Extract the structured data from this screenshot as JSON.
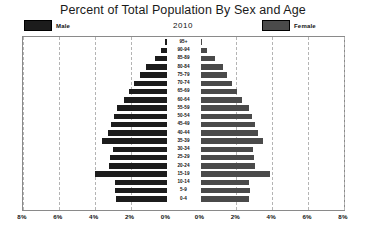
{
  "header": {
    "title": "Percent of Total Population By Sex and Age",
    "year": "2010"
  },
  "legend": {
    "male_label": "Male",
    "female_label": "Female",
    "male_color": "#1c1c1c",
    "female_color": "#4a4a4a"
  },
  "axis": {
    "tick_labels": [
      "8%",
      "6%",
      "4%",
      "2%",
      "0%",
      "0%",
      "2%",
      "4%",
      "6%",
      "8%"
    ],
    "max_percent": 8,
    "grid": true
  },
  "chart_data": {
    "type": "bar",
    "subtype": "population-pyramid",
    "title": "Percent of Total Population By Sex and Age",
    "subtitle": "2010",
    "xlabel": "",
    "ylabel": "",
    "xlim": [
      -8,
      8
    ],
    "grid": true,
    "legend_position": "top",
    "categories": [
      "95+",
      "90-94",
      "85-89",
      "80-84",
      "75-79",
      "70-74",
      "65-69",
      "60-64",
      "55-59",
      "50-54",
      "45-49",
      "40-44",
      "35-39",
      "30-34",
      "25-29",
      "20-24",
      "15-19",
      "10-14",
      "5-9",
      "0-4"
    ],
    "series": [
      {
        "name": "Male",
        "values": [
          0.08,
          0.3,
          0.65,
          1.15,
          1.5,
          1.8,
          2.1,
          2.35,
          2.75,
          2.9,
          3.1,
          3.25,
          3.6,
          3.0,
          3.15,
          3.2,
          4.0,
          2.85,
          2.85,
          2.8
        ]
      },
      {
        "name": "Female",
        "values": [
          0.1,
          0.35,
          0.8,
          1.25,
          1.5,
          1.75,
          2.05,
          2.3,
          2.7,
          2.85,
          3.05,
          3.2,
          3.5,
          2.9,
          3.0,
          3.05,
          3.85,
          2.7,
          2.75,
          2.7
        ]
      }
    ]
  }
}
